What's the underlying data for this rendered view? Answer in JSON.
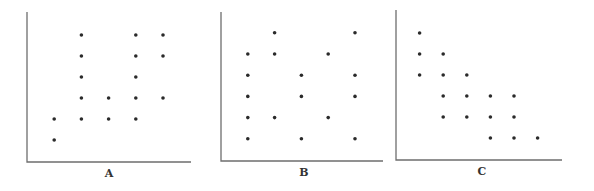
{
  "chart_data": [
    {
      "type": "scatter",
      "title": "",
      "xlabel": "A",
      "ylabel": "",
      "grid": false,
      "xlim": [
        0,
        6
      ],
      "ylim": [
        0,
        6.8
      ],
      "points": [
        {
          "x": 1,
          "y": 2
        },
        {
          "x": 1,
          "y": 1
        },
        {
          "x": 2,
          "y": 6
        },
        {
          "x": 2,
          "y": 5
        },
        {
          "x": 2,
          "y": 4
        },
        {
          "x": 2,
          "y": 3
        },
        {
          "x": 2,
          "y": 2
        },
        {
          "x": 3,
          "y": 3
        },
        {
          "x": 3,
          "y": 2
        },
        {
          "x": 4,
          "y": 6
        },
        {
          "x": 4,
          "y": 5
        },
        {
          "x": 4,
          "y": 4
        },
        {
          "x": 4,
          "y": 3
        },
        {
          "x": 4,
          "y": 2
        },
        {
          "x": 5,
          "y": 6
        },
        {
          "x": 5,
          "y": 5
        },
        {
          "x": 5,
          "y": 3
        }
      ]
    },
    {
      "type": "scatter",
      "title": "",
      "xlabel": "B",
      "ylabel": "",
      "grid": false,
      "xlim": [
        0,
        6
      ],
      "ylim": [
        0,
        6.8
      ],
      "points": [
        {
          "x": 1,
          "y": 5
        },
        {
          "x": 1,
          "y": 4
        },
        {
          "x": 1,
          "y": 3
        },
        {
          "x": 1,
          "y": 2
        },
        {
          "x": 1,
          "y": 1
        },
        {
          "x": 2,
          "y": 6
        },
        {
          "x": 2,
          "y": 5
        },
        {
          "x": 2,
          "y": 2
        },
        {
          "x": 3,
          "y": 4
        },
        {
          "x": 3,
          "y": 3
        },
        {
          "x": 3,
          "y": 1
        },
        {
          "x": 4,
          "y": 5
        },
        {
          "x": 4,
          "y": 2
        },
        {
          "x": 5,
          "y": 6
        },
        {
          "x": 5,
          "y": 4
        },
        {
          "x": 5,
          "y": 3
        },
        {
          "x": 5,
          "y": 1
        }
      ]
    },
    {
      "type": "scatter",
      "title": "",
      "xlabel": "C",
      "ylabel": "",
      "grid": false,
      "xlim": [
        0,
        7
      ],
      "ylim": [
        0,
        6.8
      ],
      "points": [
        {
          "x": 1,
          "y": 6
        },
        {
          "x": 1,
          "y": 5
        },
        {
          "x": 1,
          "y": 4
        },
        {
          "x": 2,
          "y": 5
        },
        {
          "x": 2,
          "y": 4
        },
        {
          "x": 2,
          "y": 3
        },
        {
          "x": 2,
          "y": 2
        },
        {
          "x": 3,
          "y": 4
        },
        {
          "x": 3,
          "y": 3
        },
        {
          "x": 3,
          "y": 2
        },
        {
          "x": 4,
          "y": 3
        },
        {
          "x": 4,
          "y": 2
        },
        {
          "x": 4,
          "y": 1
        },
        {
          "x": 5,
          "y": 3
        },
        {
          "x": 5,
          "y": 2
        },
        {
          "x": 5,
          "y": 1
        },
        {
          "x": 6,
          "y": 1
        }
      ]
    }
  ]
}
